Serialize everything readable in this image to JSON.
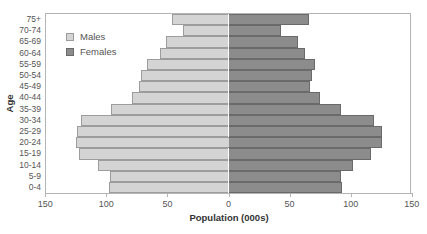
{
  "chart_data": {
    "type": "bar",
    "subtype": "population-pyramid",
    "title": "",
    "xlabel": "Population (000s)",
    "ylabel": "Age",
    "categories": [
      "75+",
      "70-74",
      "65-69",
      "60-64",
      "55-59",
      "50-54",
      "45-49",
      "40-44",
      "35-39",
      "30-34",
      "25-29",
      "20-24",
      "15-19",
      "10-14",
      "5-9",
      "0-4"
    ],
    "series": [
      {
        "name": "Males",
        "color": "#d4d4d4",
        "side": "left",
        "values": [
          46,
          37,
          51,
          56,
          67,
          72,
          73,
          79,
          96,
          121,
          124,
          125,
          122,
          107,
          97,
          98
        ]
      },
      {
        "name": "Females",
        "color": "#8c8c8c",
        "side": "right",
        "values": [
          66,
          43,
          57,
          63,
          71,
          68,
          67,
          75,
          92,
          119,
          126,
          126,
          117,
          102,
          92,
          93
        ]
      }
    ],
    "xlim": [
      -150,
      150
    ],
    "x_ticks": [
      -150,
      -100,
      -50,
      0,
      50,
      100,
      150
    ],
    "x_tick_labels": [
      "150",
      "100",
      "50",
      "0",
      "50",
      "100",
      "150"
    ],
    "grid": false,
    "legend_position": "upper-left"
  },
  "legend": {
    "items": [
      {
        "label": "Males",
        "color": "#d4d4d4",
        "border": "#9c9c9c"
      },
      {
        "label": "Females",
        "color": "#8c8c8c",
        "border": "#6a6a6a"
      }
    ]
  },
  "axes": {
    "x_title": "Population (000s)",
    "y_title": "Age"
  }
}
